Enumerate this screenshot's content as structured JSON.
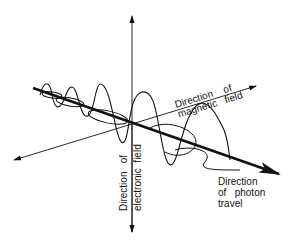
{
  "diagram": {
    "labels": {
      "magnetic_line1": "Direction    of",
      "magnetic_line2": "magnetic   field",
      "electric_line1": "Direction   of",
      "electric_line2": "electronic  field",
      "photon_line1": "Direction",
      "photon_line2": "of   photon",
      "photon_line3": "travel"
    },
    "axes": [
      {
        "name": "electric-field-axis",
        "orientation": "vertical",
        "arrows": "both"
      },
      {
        "name": "magnetic-field-axis",
        "orientation": "diagonal-up-right",
        "arrows": "both"
      },
      {
        "name": "photon-travel-axis",
        "orientation": "diagonal-down-right",
        "arrows": "end",
        "weight": "bold"
      }
    ],
    "colors": {
      "ink": "#111111",
      "background": "#ffffff"
    }
  }
}
